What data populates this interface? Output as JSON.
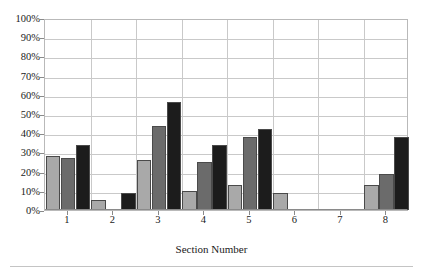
{
  "chart_data": {
    "type": "bar",
    "title": "",
    "subtitle": "",
    "xlabel": "Section Number",
    "ylabel": "",
    "categories": [
      "1",
      "2",
      "3",
      "4",
      "5",
      "6",
      "7",
      "8"
    ],
    "ylim": [
      0,
      100
    ],
    "ytick_labels": [
      "0%",
      "10%",
      "20%",
      "30%",
      "40%",
      "50%",
      "60%",
      "70%",
      "80%",
      "90%",
      "100%"
    ],
    "ytick_values": [
      0,
      10,
      20,
      30,
      40,
      50,
      60,
      70,
      80,
      90,
      100
    ],
    "grid": "horizontal-and-vertical",
    "legend": "none",
    "units": "percent",
    "series": [
      {
        "name": "series-1",
        "color": "#a9a9a9",
        "values": [
          28,
          5,
          26,
          10,
          13,
          9,
          0,
          13
        ]
      },
      {
        "name": "series-2",
        "color": "#6b6b6b",
        "values": [
          27,
          0,
          44,
          25,
          38,
          0,
          0,
          19
        ]
      },
      {
        "name": "series-3",
        "color": "#1c1c1c",
        "values": [
          34,
          9,
          56,
          34,
          42,
          0,
          0,
          38
        ]
      }
    ]
  },
  "colors": {
    "series_light": "#a9a9a9",
    "series_medium": "#6b6b6b",
    "series_dark": "#1c1c1c",
    "grid": "#c9c9c9",
    "axis": "#8a8a8a",
    "text": "#1a1a1a",
    "background": "#ffffff"
  }
}
